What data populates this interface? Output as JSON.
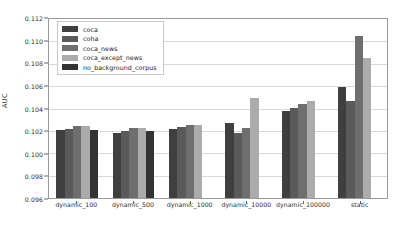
{
  "chart_data": {
    "type": "bar",
    "title": "",
    "xlabel": "",
    "ylabel": "AUC",
    "ylim": [
      0.096,
      0.112
    ],
    "ytick_step": 0.002,
    "ytick_labels": [
      "0.112",
      "0.110",
      "0.108",
      "0.106",
      "0.104",
      "0.102",
      "0.100",
      "0.098",
      "0.096"
    ],
    "ytick_values": [
      0.112,
      0.11,
      0.108,
      0.106,
      0.104,
      0.102,
      0.1,
      0.098,
      0.096
    ],
    "grid": true,
    "legend_position": "upper left",
    "categories": [
      "dynamic_100",
      "dynamic_500",
      "dynamic_1000",
      "dynamic_10000",
      "dynamic_100000",
      "static"
    ],
    "series": [
      {
        "name": "coca",
        "color": "#3f3f3f",
        "values": [
          0.10205,
          0.1018,
          0.10215,
          0.1027,
          0.10375,
          0.10595
        ]
      },
      {
        "name": "coha",
        "color": "#5a5a5a",
        "values": [
          0.10215,
          0.10195,
          0.10235,
          0.10185,
          0.10405,
          0.1047
        ]
      },
      {
        "name": "coca_news",
        "color": "#6e6e6e",
        "values": [
          0.1024,
          0.10225,
          0.10255,
          0.1023,
          0.1044,
          0.1105
        ]
      },
      {
        "name": "coca_except_news",
        "color": "#ababab",
        "values": [
          0.1024,
          0.1023,
          0.1025,
          0.1049,
          0.1047,
          0.10855
        ]
      },
      {
        "name": "no_background_corpus",
        "color": "#333333",
        "values": [
          0.1021,
          0.102,
          null,
          null,
          null,
          null
        ]
      }
    ]
  },
  "legend": {
    "items": [
      {
        "label": "coca",
        "color": "#3f3f3f"
      },
      {
        "label": "coha",
        "color": "#5a5a5a"
      },
      {
        "label": "coca_news",
        "color": "#6e6e6e"
      },
      {
        "label": "coca_except_news",
        "color": "#ababab"
      },
      {
        "label": "no_background_corpus",
        "color": "#333333"
      }
    ]
  }
}
